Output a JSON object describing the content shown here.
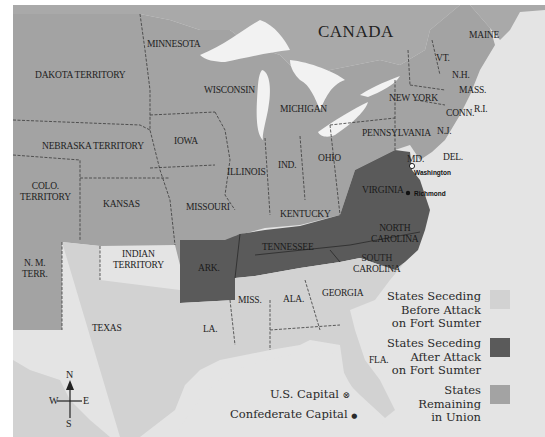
{
  "map": {
    "country_label": "CANADA",
    "colors": {
      "water": "#e4e4e4",
      "lakes": "#f2f2f2",
      "canada": "#a9a9a9",
      "union": "#a3a3a3",
      "seceding_before": "#d2d2d2",
      "seceding_after": "#5a5a5a",
      "border": "#3a3a3a"
    },
    "regions": {
      "dakota": "DAKOTA TERRITORY",
      "minnesota": "MINNESOTA",
      "wisconsin": "WISCONSIN",
      "michigan": "MICHIGAN",
      "nebraska": "NEBRASKA TERRITORY",
      "iowa": "IOWA",
      "illinois": "ILLINOIS",
      "indiana": "IND.",
      "ohio": "OHIO",
      "colorado_1": "COLO.",
      "colorado_2": "TERRITORY",
      "kansas": "KANSAS",
      "missouri": "MISSOURI",
      "kentucky": "KENTUCKY",
      "new_mexico_1": "N. M.",
      "new_mexico_2": "TERR.",
      "indian_territory_1": "INDIAN",
      "indian_territory_2": "TERRITORY",
      "arkansas": "ARK.",
      "tennessee": "TENNESSEE",
      "texas": "TEXAS",
      "louisiana": "LA.",
      "mississippi": "MISS.",
      "alabama": "ALA.",
      "georgia": "GEORGIA",
      "florida": "FLA.",
      "south_carolina_1": "SOUTH",
      "south_carolina_2": "CAROLINA",
      "north_carolina_1": "NORTH",
      "north_carolina_2": "CAROLINA",
      "virginia": "VIRGINIA",
      "maryland": "MD.",
      "delaware": "DEL.",
      "pennsylvania": "PENNSYLVANIA",
      "new_jersey": "N.J.",
      "new_york": "NEW YORK",
      "connecticut": "CONN.",
      "rhode_island": "R.I.",
      "massachusetts": "MASS.",
      "vermont": "VT.",
      "new_hampshire": "N.H.",
      "maine": "MAINE"
    },
    "cities": {
      "washington": "Washington",
      "richmond": "Richmond"
    }
  },
  "legend": {
    "items": [
      {
        "line1": "States Seceding",
        "line2": "Before Attack",
        "line3": "on Fort Sumter",
        "color": "#d2d2d2"
      },
      {
        "line1": "States Seceding",
        "line2": "After Attack",
        "line3": "on Fort Sumter",
        "color": "#5a5a5a"
      },
      {
        "line1": "States",
        "line2": "Remaining",
        "line3": "in Union",
        "color": "#a3a3a3"
      }
    ],
    "us_capital_label": "U.S. Capital",
    "us_capital_symbol": "⊗",
    "confederate_capital_label": "Confederate Capital",
    "confederate_capital_symbol": "●"
  },
  "compass": {
    "n": "N",
    "s": "S",
    "e": "E",
    "w": "W"
  }
}
